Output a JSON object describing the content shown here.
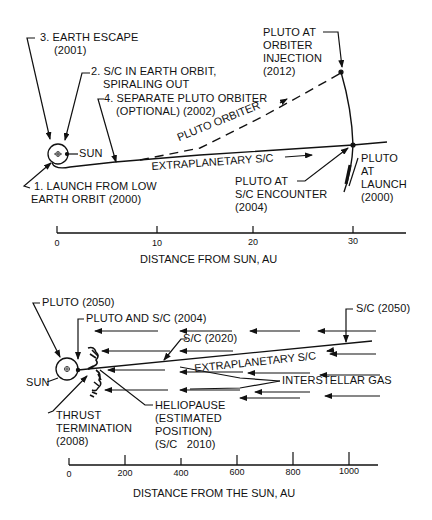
{
  "top_diagram": {
    "labels": {
      "earth_escape": [
        "3. EARTH ESCAPE",
        "(2001)"
      ],
      "earth_orbit": [
        "2. S/C IN EARTH ORBIT,",
        "SPIRALING OUT"
      ],
      "separate_orbiter": [
        "4. SEPARATE PLUTO ORBITER",
        "(OPTIONAL)  (2002)"
      ],
      "sun": "SUN",
      "launch": [
        "1. LAUNCH FROM LOW",
        "EARTH ORBIT (2000)"
      ],
      "pluto_orbiter_path": "PLUTO ORBITER",
      "extraplanetary_path": "EXTRAPLANETARY S/C",
      "pluto_injection": [
        "PLUTO AT",
        "ORBITER",
        "INJECTION",
        "(2012)"
      ],
      "pluto_encounter": [
        "PLUTO AT",
        "S/C ENCOUNTER",
        "(2004)"
      ],
      "pluto_launch": [
        "PLUTO",
        "AT",
        "LAUNCH",
        "(2000)"
      ]
    },
    "axis": {
      "title": "DISTANCE FROM SUN, AU",
      "ticks": [
        "0",
        "10",
        "20",
        "30"
      ]
    }
  },
  "bottom_diagram": {
    "labels": {
      "pluto_2050": "PLUTO (2050)",
      "pluto_sc_2004": "PLUTO AND S/C (2004)",
      "sc_2020": "S/C (2020)",
      "sc_2050": "S/C (2050)",
      "sun": "SUN",
      "extraplanetary_path": "EXTRAPLANETARY S/C",
      "interstellar_gas": "INTERSTELLAR GAS",
      "thrust_termination": [
        "THRUST",
        "TERMINATION",
        "(2008)"
      ],
      "heliopause": [
        "HELIOPAUSE",
        "(ESTIMATED",
        "POSITION)",
        "(S/C   2010)"
      ]
    },
    "axis": {
      "title": "DISTANCE FROM THE SUN, AU",
      "ticks": [
        "0",
        "200",
        "400",
        "600",
        "800",
        "1000"
      ]
    }
  },
  "colors": {
    "ink": "#111111",
    "background": "#ffffff"
  }
}
